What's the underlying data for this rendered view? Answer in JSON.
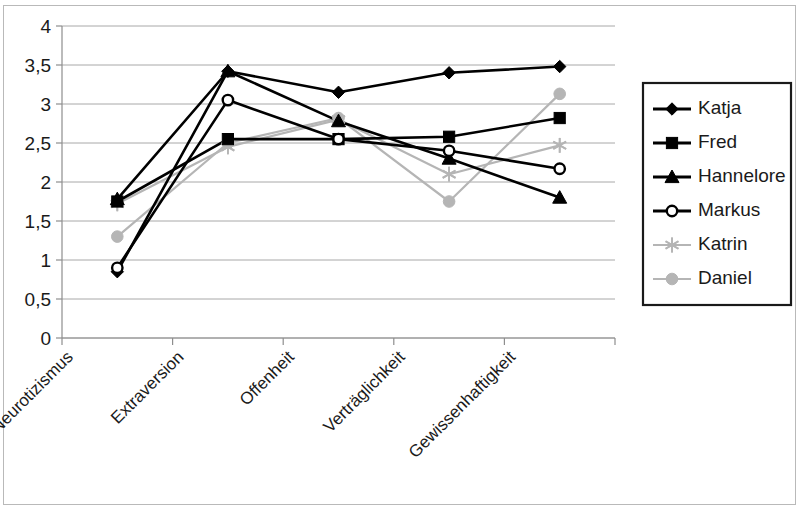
{
  "chart_data": {
    "type": "line",
    "title": "",
    "subtitle": "",
    "xlabel": "",
    "ylabel": "",
    "categories": [
      "Neurotizismus",
      "Extraversion",
      "Offenheit",
      "Verträglichkeit",
      "Gewissenhaftigkeit"
    ],
    "ylim": [
      0,
      4
    ],
    "ytick_labels": [
      "0",
      "0,5",
      "1",
      "1,5",
      "2",
      "2,5",
      "3",
      "3,5",
      "4"
    ],
    "ytick_values": [
      0,
      0.5,
      1,
      1.5,
      2,
      2.5,
      3,
      3.5,
      4
    ],
    "grid": true,
    "legend_position": "right",
    "series": [
      {
        "name": "Katja",
        "marker": "diamond",
        "color": "#000000",
        "values": [
          0.85,
          3.42,
          3.15,
          3.4,
          3.48
        ]
      },
      {
        "name": "Fred",
        "marker": "square",
        "color": "#000000",
        "values": [
          1.75,
          2.55,
          2.55,
          2.58,
          2.82
        ]
      },
      {
        "name": "Hannelore",
        "marker": "triangle",
        "color": "#000000",
        "values": [
          1.78,
          3.42,
          2.78,
          2.3,
          1.8
        ]
      },
      {
        "name": "Markus",
        "marker": "open-circle",
        "color": "#000000",
        "values": [
          0.9,
          3.05,
          2.55,
          2.4,
          2.17
        ]
      },
      {
        "name": "Katrin",
        "marker": "asterisk",
        "color": "#b5b5b5",
        "values": [
          1.72,
          2.45,
          2.8,
          2.1,
          2.47
        ]
      },
      {
        "name": "Daniel",
        "marker": "circle",
        "color": "#b5b5b5",
        "values": [
          1.3,
          2.5,
          2.82,
          1.75,
          3.13
        ]
      }
    ]
  },
  "legend": {
    "entries": [
      "Katja",
      "Fred",
      "Hannelore",
      "Markus",
      "Katrin",
      "Daniel"
    ]
  },
  "colors": {
    "series_dark": "#000000",
    "series_light": "#b5b5b5",
    "gridline": "#a8a8a8",
    "axis": "#8e8e8e",
    "text": "#1a1a1a",
    "frame": "#b9b9b9",
    "background": "#ffffff"
  }
}
